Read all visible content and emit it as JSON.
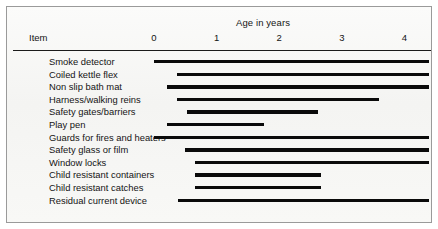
{
  "chart_data": {
    "type": "bar",
    "title": "",
    "xlabel": "Age in years",
    "ylabel": "Item",
    "orientation": "horizontal",
    "style": "gantt-range-bars",
    "xlim": [
      0,
      4.45
    ],
    "xticks": [
      0,
      1,
      2,
      3,
      4
    ],
    "xtick_labels": [
      "0",
      "1",
      "2",
      "3",
      "4"
    ],
    "grid": false,
    "legend": false,
    "bar_color": "#0a0a0a",
    "categories": [
      "Smoke detector",
      "Coiled kettle flex",
      "Non slip bath mat",
      "Harness/walking reins",
      "Safety gates/barriers",
      "Play pen",
      "Guards for fires and heaters",
      "Safety glass or film",
      "Window locks",
      "Child resistant containers",
      "Child resistant catches",
      "Residual current device"
    ],
    "ranges": [
      {
        "label": "Smoke detector",
        "start": 0.0,
        "end": 4.4
      },
      {
        "label": "Coiled kettle flex",
        "start": 0.37,
        "end": 4.4
      },
      {
        "label": "Non slip bath mat",
        "start": 0.2,
        "end": 4.4
      },
      {
        "label": "Harness/walking reins",
        "start": 0.37,
        "end": 3.6
      },
      {
        "label": "Safety gates/barriers",
        "start": 0.53,
        "end": 2.62
      },
      {
        "label": "Play pen",
        "start": 0.2,
        "end": 1.75
      },
      {
        "label": "Guards for fires and heaters",
        "start": 0.0,
        "end": 4.4
      },
      {
        "label": "Safety glass or film",
        "start": 0.5,
        "end": 4.4
      },
      {
        "label": "Window locks",
        "start": 0.66,
        "end": 4.4
      },
      {
        "label": "Child resistant containers",
        "start": 0.66,
        "end": 2.66
      },
      {
        "label": "Child resistant catches",
        "start": 0.66,
        "end": 2.66
      },
      {
        "label": "Residual current device",
        "start": 0.39,
        "end": 4.4
      }
    ]
  },
  "header": {
    "axis_title": "Age in years",
    "item_column": "Item"
  }
}
